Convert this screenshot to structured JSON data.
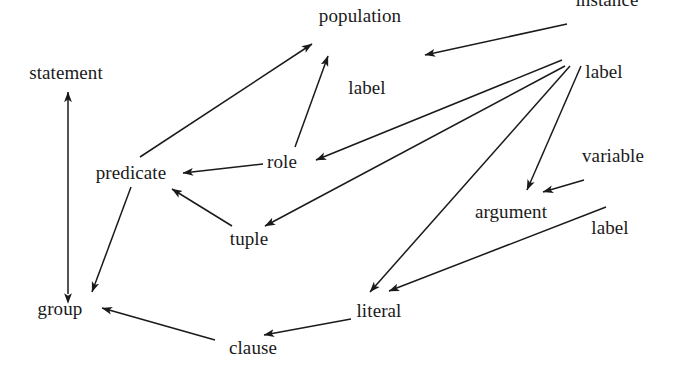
{
  "diagram": {
    "title": "",
    "background_color": "#ffffff",
    "stroke_color": "#1a1a1a",
    "text_color": "#1a1a1a",
    "width": 686,
    "height": 372,
    "nodes": [
      {
        "id": "statement",
        "label": "statement",
        "x": 66,
        "y": 72
      },
      {
        "id": "population_label",
        "line1": "population",
        "line2": "label",
        "x": 360,
        "y": 52
      },
      {
        "id": "instance_label",
        "line1": "instance",
        "line2": "label",
        "x": 607,
        "y": 36
      },
      {
        "id": "predicate",
        "label": "predicate",
        "x": 131,
        "y": 172
      },
      {
        "id": "role",
        "label": "role",
        "x": 282,
        "y": 161
      },
      {
        "id": "variable_label",
        "line1": "variable",
        "line2": "label",
        "x": 613,
        "y": 192
      },
      {
        "id": "argument",
        "label": "argument",
        "x": 511,
        "y": 211
      },
      {
        "id": "tuple",
        "label": "tuple",
        "x": 249,
        "y": 238
      },
      {
        "id": "group",
        "label": "group",
        "x": 60,
        "y": 308
      },
      {
        "id": "literal",
        "label": "literal",
        "x": 379,
        "y": 310
      },
      {
        "id": "clause",
        "label": "clause",
        "x": 253,
        "y": 347
      }
    ],
    "edges": [
      {
        "id": "statement-group",
        "from": "group",
        "to": "statement",
        "arrows": "both",
        "note": "vertical double-headed arrow"
      },
      {
        "id": "predicate-population",
        "from": "predicate",
        "to": "population_label",
        "arrows": "end"
      },
      {
        "id": "role-population",
        "from": "role",
        "to": "population_label",
        "arrows": "end"
      },
      {
        "id": "instance-population",
        "from": "instance_label",
        "to": "population_label",
        "arrows": "end"
      },
      {
        "id": "role-predicate",
        "from": "role",
        "to": "predicate",
        "arrows": "end"
      },
      {
        "id": "label-role",
        "from": "instance_label",
        "to": "role",
        "arrows": "end"
      },
      {
        "id": "label-tuple",
        "from": "instance_label",
        "to": "tuple",
        "arrows": "end"
      },
      {
        "id": "label-literal",
        "from": "instance_label",
        "to": "literal",
        "arrows": "end"
      },
      {
        "id": "label-argument",
        "from": "instance_label",
        "to": "argument",
        "arrows": "end"
      },
      {
        "id": "variable-argument",
        "from": "variable_label",
        "to": "argument",
        "arrows": "end"
      },
      {
        "id": "variablelabel-literal",
        "from": "variable_label",
        "to": "literal",
        "arrows": "end"
      },
      {
        "id": "tuple-predicate",
        "from": "tuple",
        "to": "predicate",
        "arrows": "end"
      },
      {
        "id": "predicate-group",
        "from": "predicate",
        "to": "group",
        "arrows": "end"
      },
      {
        "id": "clause-group",
        "from": "clause",
        "to": "group",
        "arrows": "end"
      },
      {
        "id": "literal-clause",
        "from": "literal",
        "to": "clause",
        "arrows": "end"
      }
    ]
  }
}
